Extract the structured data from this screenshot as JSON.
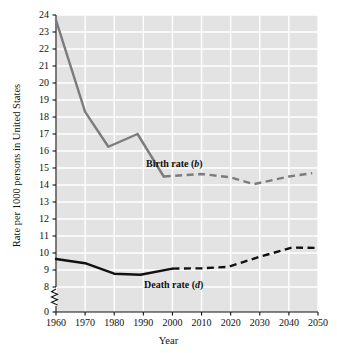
{
  "chart_data": {
    "type": "line",
    "title": "",
    "xlabel": "Year",
    "ylabel": "Rate per 1000 persons in United States",
    "xlim": [
      1960,
      2050
    ],
    "ylim": [
      8,
      24
    ],
    "y_axis_break": true,
    "y_axis_break_from": 0,
    "y_axis_break_to": 8,
    "grid": true,
    "grid_color": "#ffffff",
    "plot_background": "#e3e3e3",
    "legend_position": "inline-annotation",
    "xticks": [
      1960,
      1970,
      1980,
      1990,
      2000,
      2010,
      2020,
      2030,
      2040,
      2050
    ],
    "xtick_labels": [
      "1960",
      "1970",
      "1980",
      "1990",
      "2000",
      "2010",
      "2020",
      "2030",
      "2040",
      "2050"
    ],
    "yticks": [
      0,
      8,
      9,
      10,
      11,
      12,
      13,
      14,
      15,
      16,
      17,
      18,
      19,
      20,
      21,
      22,
      23,
      24
    ],
    "ytick_labels": [
      "0",
      "8",
      "9",
      "10",
      "11",
      "12",
      "13",
      "14",
      "15",
      "16",
      "17",
      "18",
      "19",
      "20",
      "21",
      "22",
      "23",
      "24"
    ],
    "series": [
      {
        "name": "Birth rate (b)",
        "symbol": "b",
        "color": "#7c7c7c",
        "label_text": "Birth rate (",
        "label_suffix": ")",
        "solid": {
          "x": [
            1960,
            1970,
            1978,
            1988,
            1997
          ],
          "y": [
            23.7,
            18.3,
            16.25,
            17.0,
            14.5
          ]
        },
        "dashed": {
          "x": [
            1997,
            2010,
            2020,
            2028,
            2040,
            2048
          ],
          "y": [
            14.5,
            14.65,
            14.45,
            14.05,
            14.5,
            14.7
          ]
        }
      },
      {
        "name": "Death rate (d)",
        "symbol": "d",
        "color": "#111111",
        "label_text": "Death rate (",
        "label_suffix": ")",
        "solid": {
          "x": [
            1960,
            1970,
            1980,
            1989,
            2000
          ],
          "y": [
            9.65,
            9.4,
            8.78,
            8.72,
            9.08
          ]
        },
        "dashed": {
          "x": [
            2000,
            2010,
            2019,
            2030,
            2041,
            2050
          ],
          "y": [
            9.08,
            9.1,
            9.18,
            9.78,
            10.32,
            10.3
          ]
        }
      }
    ]
  },
  "axes": {
    "x_title": "Year",
    "y_title": "Rate per 1000 persons in United States"
  },
  "annotations": {
    "birth_rate_label_plain": "Birth rate (",
    "birth_rate_symbol": "b",
    "birth_rate_close": ")",
    "death_rate_label_plain": "Death rate (",
    "death_rate_symbol": "d",
    "death_rate_close": ")"
  }
}
